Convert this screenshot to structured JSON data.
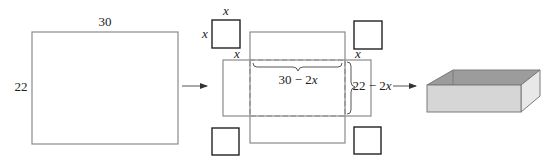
{
  "sheet": {
    "width_label": "30",
    "height_label": "22"
  },
  "cut_squares": {
    "side_label": "x"
  },
  "net": {
    "base_width_label": "30 − 2x",
    "base_height_label": "22 − 2x",
    "corner_label": "x"
  },
  "colors": {
    "outline": "#8a8a8a",
    "square": "#222222",
    "box_inside": "#9c9c9c",
    "box_front": "#d6d6d6",
    "box_side": "#e8e8e8",
    "box_edge": "#7a7a7a"
  },
  "arrows": [
    {
      "name": "sheet-to-net"
    },
    {
      "name": "net-to-box"
    }
  ]
}
